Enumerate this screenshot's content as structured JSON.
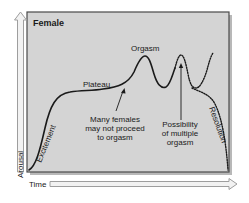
{
  "figure": {
    "title": "Female",
    "colors": {
      "panel_fill": "#d4d4d4",
      "panel_border": "#4a4a4a",
      "shadow": "#9a9a9a",
      "curve": "#1a1a1a",
      "arrow_outline": "#9e9e9e",
      "arrow_fill": "#f2f2f2",
      "background": "#ffffff"
    }
  },
  "axes": {
    "y_label": "Arousal",
    "x_label": "Time"
  },
  "phases": {
    "excitement": "Excitement",
    "plateau": "Plateau",
    "orgasm": "Orgasm",
    "resolution": "Resolution"
  },
  "annotations": {
    "no_orgasm": {
      "line1": "Many females",
      "line2": "may not proceed",
      "line3": "to orgasm"
    },
    "multiple": {
      "line1": "Possibility",
      "line2": "of multiple",
      "line3": "orgasm"
    }
  }
}
